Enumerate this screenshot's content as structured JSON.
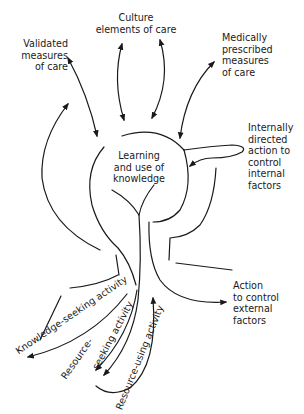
{
  "diagram": {
    "type": "conceptual flow diagram",
    "center": {
      "label": "Learning\nand use of\nknowledge"
    },
    "inputs": [
      {
        "id": "validated",
        "label": "Validated\nmeasures\nof care"
      },
      {
        "id": "culture",
        "label": "Culture\nelements of care"
      },
      {
        "id": "medical",
        "label": "Medically\nprescribed\nmeasures\nof care"
      }
    ],
    "outputs": [
      {
        "id": "internal",
        "label": "Internally\ndirected\naction to\ncontrol\ninternal\nfactors"
      },
      {
        "id": "external",
        "label": "Action\nto control\nexternal\nfactors"
      }
    ],
    "activities": [
      {
        "id": "knowledge-seeking",
        "label": "Knowledge-seeking activity"
      },
      {
        "id": "resource-seeking-1",
        "label": "Resource-"
      },
      {
        "id": "resource-seeking-2",
        "label": "seeking activity"
      },
      {
        "id": "resource-using",
        "label": "Resource-using activity"
      }
    ],
    "colors": {
      "ink": "#1a1a1a",
      "background": "#ffffff"
    }
  }
}
